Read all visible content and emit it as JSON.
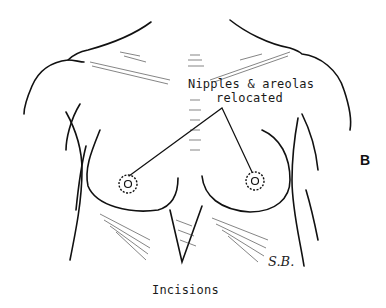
{
  "figure": {
    "panel_letter": "B",
    "labels": {
      "nipples_line1": "Nipples & areolas",
      "nipples_line2": "relocated",
      "incisions": "Incisions"
    },
    "signature": "S.B.",
    "colors": {
      "ink": "#111111",
      "background": "#ffffff"
    }
  }
}
